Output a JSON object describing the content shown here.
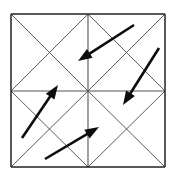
{
  "figure": {
    "title": "Grid of four squares with diagonals and four overlaid arrows",
    "canvas": {
      "width": 174,
      "height": 179
    },
    "background_color": "#ffffff",
    "colors": {
      "frame": "#222222",
      "diagonal": "#4a4a4a",
      "midline": "#555555",
      "arrow": "#0d0d0d"
    },
    "grid": {
      "description": "2 by 2 arrangement of squares, each square crossed by both of its diagonals",
      "columns": 2,
      "rows": 2,
      "bounds": {
        "left": 11,
        "top": 14,
        "right": 165,
        "bottom": 167
      },
      "center": {
        "x": 88,
        "y": 91
      },
      "frame_segments": [
        {
          "name": "outer-top",
          "x1": 11,
          "y1": 14,
          "x2": 165,
          "y2": 14
        },
        {
          "name": "outer-right",
          "x1": 165,
          "y1": 14,
          "x2": 165,
          "y2": 167
        },
        {
          "name": "outer-bottom",
          "x1": 11,
          "y1": 167,
          "x2": 165,
          "y2": 167
        },
        {
          "name": "outer-left",
          "x1": 11,
          "y1": 14,
          "x2": 11,
          "y2": 167
        }
      ],
      "mid_segments": [
        {
          "name": "vertical-midline",
          "x1": 88,
          "y1": 14,
          "x2": 88,
          "y2": 167
        },
        {
          "name": "horizontal-midline",
          "x1": 11,
          "y1": 91,
          "x2": 165,
          "y2": 91
        }
      ],
      "diagonal_segments": [
        {
          "name": "cell-tl-diag-down",
          "x1": 11,
          "y1": 14,
          "x2": 88,
          "y2": 91
        },
        {
          "name": "cell-tl-diag-up",
          "x1": 88,
          "y1": 14,
          "x2": 11,
          "y2": 91
        },
        {
          "name": "cell-tr-diag-down",
          "x1": 88,
          "y1": 14,
          "x2": 165,
          "y2": 91
        },
        {
          "name": "cell-tr-diag-up",
          "x1": 165,
          "y1": 14,
          "x2": 88,
          "y2": 91
        },
        {
          "name": "cell-bl-diag-down",
          "x1": 11,
          "y1": 91,
          "x2": 88,
          "y2": 167
        },
        {
          "name": "cell-bl-diag-up",
          "x1": 88,
          "y1": 91,
          "x2": 11,
          "y2": 167
        },
        {
          "name": "cell-br-diag-down",
          "x1": 88,
          "y1": 91,
          "x2": 165,
          "y2": 167
        },
        {
          "name": "cell-br-diag-up",
          "x1": 165,
          "y1": 91,
          "x2": 88,
          "y2": 167
        }
      ]
    },
    "arrows": [
      {
        "name": "arrow-upper-pointing-down-left",
        "tail": {
          "x": 134,
          "y": 25
        },
        "tip": {
          "x": 78,
          "y": 61
        },
        "direction": "down-left"
      },
      {
        "name": "arrow-right-pointing-down-left",
        "tail": {
          "x": 159,
          "y": 48
        },
        "tip": {
          "x": 123,
          "y": 105
        },
        "direction": "down-left"
      },
      {
        "name": "arrow-left-pointing-up-right",
        "tail": {
          "x": 22,
          "y": 138
        },
        "tip": {
          "x": 58,
          "y": 85
        },
        "direction": "up-right"
      },
      {
        "name": "arrow-lower-pointing-up-right",
        "tail": {
          "x": 45,
          "y": 159
        },
        "tip": {
          "x": 99,
          "y": 127
        },
        "direction": "up-right"
      }
    ]
  }
}
